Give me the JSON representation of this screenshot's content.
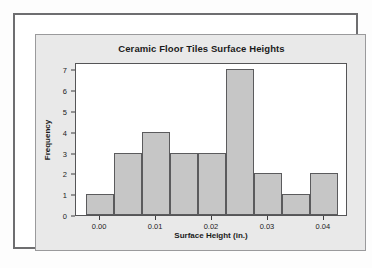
{
  "chart_data": {
    "type": "bar",
    "title": "Ceramic Floor Tiles Surface Heights",
    "xlabel": "Surface Height (in.)",
    "ylabel": "Frequency",
    "bin_width": 0.005,
    "bin_starts": [
      -0.0025,
      0.0025,
      0.0075,
      0.0125,
      0.0175,
      0.0225,
      0.0275,
      0.0325,
      0.0375
    ],
    "categories": [
      "-0.0025 to 0.0025",
      "0.0025 to 0.0075",
      "0.0075 to 0.0125",
      "0.0125 to 0.0175",
      "0.0175 to 0.0225",
      "0.0225 to 0.0275",
      "0.0275 to 0.0325",
      "0.0325 to 0.0375",
      "0.0375 to 0.0425"
    ],
    "values": [
      1,
      3,
      4,
      3,
      3,
      7,
      2,
      1,
      2
    ],
    "bars_visible": [
      {
        "start": -0.0025,
        "end": 0.0025,
        "value": 1
      },
      {
        "start": 0.0025,
        "end": 0.0075,
        "value": 3
      },
      {
        "start": 0.0075,
        "end": 0.0125,
        "value": 4
      },
      {
        "start": 0.0125,
        "end": 0.0175,
        "value": 3
      },
      {
        "start": 0.0175,
        "end": 0.0225,
        "value": 3
      },
      {
        "start": 0.0225,
        "end": 0.0275,
        "value": 7
      },
      {
        "start": 0.0275,
        "end": 0.0325,
        "value": 2
      },
      {
        "start": 0.0325,
        "end": 0.0375,
        "value": 1
      },
      {
        "start": 0.0375,
        "end": 0.0425,
        "value": 2
      }
    ],
    "y_ticks": [
      0,
      1,
      2,
      3,
      4,
      5,
      6,
      7
    ],
    "y_tick_labels": [
      "0",
      "1",
      "2",
      "3",
      "4",
      "5",
      "6",
      "7"
    ],
    "ylim": [
      0,
      7.35
    ],
    "x_ticks": [
      0.0,
      0.01,
      0.02,
      0.03,
      0.04
    ],
    "x_tick_labels": [
      "0.00",
      "0.01",
      "0.02",
      "0.03",
      "0.04"
    ],
    "xlim": [
      -0.0043,
      0.0443
    ],
    "grid": false,
    "legend": "none",
    "bar_fill_color": "#c6c6c6",
    "bar_edge_color": "#5b5b5d",
    "panel_color": "#e9e9e9",
    "plot_color": "#ffffff"
  }
}
